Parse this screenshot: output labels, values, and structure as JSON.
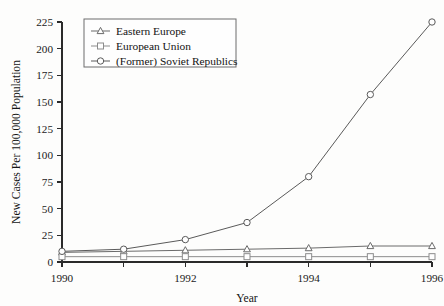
{
  "chart_data": {
    "type": "line",
    "title": "",
    "xlabel": "Year",
    "ylabel": "New Cases Per 100,000 Population",
    "x": [
      1990,
      1991,
      1992,
      1993,
      1994,
      1995,
      1996
    ],
    "xtick_labels": [
      "1990",
      "1992",
      "1994",
      "1996"
    ],
    "xtick_values": [
      1990,
      1992,
      1994,
      1996
    ],
    "xlim": [
      1990,
      1996
    ],
    "ylim": [
      0,
      225
    ],
    "ytick_labels": [
      "0",
      "25",
      "50",
      "75",
      "100",
      "125",
      "150",
      "175",
      "200",
      "225"
    ],
    "ytick_values": [
      0,
      25,
      50,
      75,
      100,
      125,
      150,
      175,
      200,
      225
    ],
    "grid": false,
    "legend_position": "top-left",
    "series": [
      {
        "name": "Eastern Europe",
        "marker": "triangle",
        "color": "#6b6b6b",
        "values": [
          9,
          10,
          11,
          12,
          13,
          15,
          15
        ]
      },
      {
        "name": "European Union",
        "marker": "square",
        "color": "#8c8c8c",
        "values": [
          5,
          5,
          5,
          5,
          5,
          5,
          5
        ]
      },
      {
        "name": "(Former) Soviet Republics",
        "marker": "circle",
        "color": "#5a5a5a",
        "values": [
          10,
          12,
          21,
          37,
          80,
          157,
          225
        ]
      }
    ]
  },
  "axis": {
    "x_title": "Year",
    "y_title": "New Cases Per 100,000 Population"
  },
  "legend": {
    "entries": [
      {
        "label": "Eastern Europe",
        "marker": "triangle-icon"
      },
      {
        "label": "European Union",
        "marker": "square-icon"
      },
      {
        "label": "(Former) Soviet Republics",
        "marker": "circle-icon"
      }
    ]
  },
  "colors": {
    "background": "#fdfdfc",
    "axis": "#2a2a2a",
    "text": "#1b1b1b",
    "legend_border": "#6d6d6d"
  }
}
